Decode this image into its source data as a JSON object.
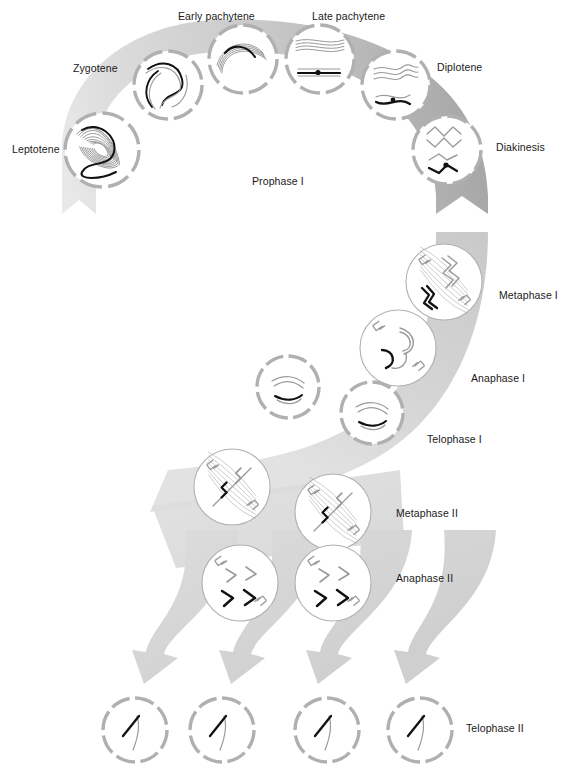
{
  "figure": {
    "colors": {
      "band_light": "#dcdcdc",
      "band_mid": "#c9c9c9",
      "band_dark": "#a8a8a8",
      "envelope": "#b0b0b0",
      "chromosome_light": "#9a9a9a",
      "chromosome_dark": "#111111",
      "label_text": "#1a1a1a",
      "page_background": "#ffffff"
    }
  },
  "labels": [
    {
      "id": "early-pachytene",
      "text": "Early pachytene",
      "x": 178,
      "y": 11,
      "anchor": "start"
    },
    {
      "id": "late-pachytene",
      "text": "Late pachytene",
      "x": 312,
      "y": 11,
      "anchor": "start"
    },
    {
      "id": "zygotene",
      "text": "Zygotene",
      "x": 73,
      "y": 63,
      "anchor": "start"
    },
    {
      "id": "diplotene",
      "text": "Diplotene",
      "x": 437,
      "y": 62,
      "anchor": "start"
    },
    {
      "id": "leptotene",
      "text": "Leptotene",
      "x": 12,
      "y": 144,
      "anchor": "start"
    },
    {
      "id": "diakinesis",
      "text": "Diakinesis",
      "x": 496,
      "y": 142,
      "anchor": "start"
    },
    {
      "id": "prophase-1",
      "text": "Prophase I",
      "x": 252,
      "y": 176,
      "anchor": "start"
    },
    {
      "id": "metaphase-1",
      "text": "Metaphase I",
      "x": 499,
      "y": 290,
      "anchor": "start"
    },
    {
      "id": "anaphase-1",
      "text": "Anaphase I",
      "x": 471,
      "y": 373,
      "anchor": "start"
    },
    {
      "id": "telophase-1",
      "text": "Telophase I",
      "x": 427,
      "y": 434,
      "anchor": "start"
    },
    {
      "id": "metaphase-2",
      "text": "Metaphase II",
      "x": 396,
      "y": 508,
      "anchor": "start"
    },
    {
      "id": "anaphase-2",
      "text": "Anaphase II",
      "x": 396,
      "y": 573,
      "anchor": "start"
    },
    {
      "id": "telophase-2",
      "text": "Telophase II",
      "x": 466,
      "y": 723,
      "anchor": "start"
    }
  ],
  "cells": [
    {
      "id": "leptotene",
      "cx": 102,
      "cy": 150,
      "r": 37,
      "envelope": "dashed",
      "stage": "leptotene"
    },
    {
      "id": "zygotene",
      "cx": 168,
      "cy": 85,
      "r": 34,
      "envelope": "dashed",
      "stage": "zygotene"
    },
    {
      "id": "early-pachytene",
      "cx": 243,
      "cy": 59,
      "r": 34,
      "envelope": "dashed",
      "stage": "early-pachytene"
    },
    {
      "id": "late-pachytene",
      "cx": 320,
      "cy": 59,
      "r": 34,
      "envelope": "dashed",
      "stage": "late-pachytene"
    },
    {
      "id": "diplotene",
      "cx": 396,
      "cy": 85,
      "r": 34,
      "envelope": "dashed",
      "stage": "diplotene"
    },
    {
      "id": "diakinesis",
      "cx": 447,
      "cy": 150,
      "r": 34,
      "envelope": "dashed",
      "stage": "diakinesis"
    },
    {
      "id": "metaphase-1",
      "cx": 444,
      "cy": 282,
      "r": 38,
      "envelope": "solid",
      "stage": "metaphase-1"
    },
    {
      "id": "anaphase-1",
      "cx": 398,
      "cy": 348,
      "r": 38,
      "envelope": "solid",
      "stage": "anaphase-1"
    },
    {
      "id": "telophase-1-a",
      "cx": 288,
      "cy": 387,
      "r": 31,
      "envelope": "dashed",
      "stage": "telophase-1"
    },
    {
      "id": "telophase-1-b",
      "cx": 372,
      "cy": 413,
      "r": 31,
      "envelope": "dashed",
      "stage": "telophase-1"
    },
    {
      "id": "metaphase-2-a",
      "cx": 232,
      "cy": 487,
      "r": 38,
      "envelope": "solid",
      "stage": "metaphase-2"
    },
    {
      "id": "metaphase-2-b",
      "cx": 333,
      "cy": 512,
      "r": 38,
      "envelope": "solid",
      "stage": "metaphase-2"
    },
    {
      "id": "anaphase-2-a",
      "cx": 240,
      "cy": 583,
      "r": 38,
      "envelope": "solid",
      "stage": "anaphase-2"
    },
    {
      "id": "anaphase-2-b",
      "cx": 333,
      "cy": 583,
      "r": 38,
      "envelope": "solid",
      "stage": "anaphase-2"
    },
    {
      "id": "telophase-2-a",
      "cx": 135,
      "cy": 730,
      "r": 32,
      "envelope": "dashed",
      "stage": "telophase-2"
    },
    {
      "id": "telophase-2-b",
      "cx": 222,
      "cy": 730,
      "r": 32,
      "envelope": "dashed",
      "stage": "telophase-2"
    },
    {
      "id": "telophase-2-c",
      "cx": 327,
      "cy": 730,
      "r": 32,
      "envelope": "dashed",
      "stage": "telophase-2"
    },
    {
      "id": "telophase-2-d",
      "cx": 420,
      "cy": 730,
      "r": 32,
      "envelope": "dashed",
      "stage": "telophase-2"
    }
  ],
  "flow": {
    "description": "Shaded band sweeping from lower-left through an arc across the top, down the right, then branching into four arrows at the bottom",
    "arrowheads": 5
  }
}
